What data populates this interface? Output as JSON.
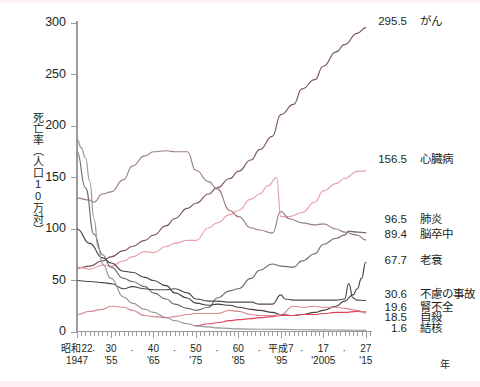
{
  "chart_data": {
    "type": "line",
    "title": "",
    "ylabel": "死亡率（人口10万対）",
    "xlabel": "年",
    "ylim": [
      0,
      300
    ],
    "xlim": [
      1947,
      2016
    ],
    "grid": false,
    "legend_position": "right-inline-callouts",
    "y_ticks": [
      "0",
      "50",
      "100",
      "150",
      "200",
      "250",
      "300"
    ],
    "x_ticks": [
      {
        "era": "昭和22",
        "west": "1947",
        "x": 1947
      },
      {
        "era": "30",
        "west": "'55",
        "x": 1955
      },
      {
        "era": "40",
        "west": "'65",
        "x": 1965
      },
      {
        "era": "50",
        "west": "'75",
        "x": 1975
      },
      {
        "era": "60",
        "west": "'85",
        "x": 1985
      },
      {
        "era": "平成7",
        "west": "'95",
        "x": 1995
      },
      {
        "era": "17",
        "west": "'2005",
        "x": 2005
      },
      {
        "era": "27",
        "west": "'15",
        "x": 2015
      }
    ],
    "x_unit_label": "年",
    "series": [
      {
        "name": "がん",
        "end_value": "295.5",
        "color": "#7a5560",
        "values": [
          [
            1947,
            62
          ],
          [
            1950,
            64
          ],
          [
            1953,
            69
          ],
          [
            1955,
            73
          ],
          [
            1958,
            79
          ],
          [
            1960,
            83
          ],
          [
            1963,
            89
          ],
          [
            1965,
            94
          ],
          [
            1968,
            103
          ],
          [
            1970,
            110
          ],
          [
            1973,
            120
          ],
          [
            1975,
            125
          ],
          [
            1978,
            134
          ],
          [
            1980,
            140
          ],
          [
            1983,
            149
          ],
          [
            1985,
            156
          ],
          [
            1988,
            167
          ],
          [
            1990,
            177
          ],
          [
            1993,
            190
          ],
          [
            1995,
            211
          ],
          [
            1998,
            221
          ],
          [
            2000,
            236
          ],
          [
            2003,
            245
          ],
          [
            2005,
            258
          ],
          [
            2008,
            272
          ],
          [
            2010,
            279
          ],
          [
            2013,
            290
          ],
          [
            2015,
            295.5
          ]
        ]
      },
      {
        "name": "心臓病",
        "end_value": "156.5",
        "color": "#e8a0a8",
        "values": [
          [
            1947,
            63
          ],
          [
            1950,
            61
          ],
          [
            1953,
            65
          ],
          [
            1955,
            64
          ],
          [
            1958,
            69
          ],
          [
            1960,
            73
          ],
          [
            1963,
            78
          ],
          [
            1965,
            77
          ],
          [
            1968,
            83
          ],
          [
            1970,
            86
          ],
          [
            1973,
            89
          ],
          [
            1975,
            89
          ],
          [
            1978,
            101
          ],
          [
            1980,
            106
          ],
          [
            1983,
            114
          ],
          [
            1985,
            118
          ],
          [
            1988,
            129
          ],
          [
            1990,
            134
          ],
          [
            1992,
            142
          ],
          [
            1994,
            150
          ],
          [
            1995,
            112
          ],
          [
            1997,
            112
          ],
          [
            2000,
            116
          ],
          [
            2003,
            126
          ],
          [
            2005,
            137
          ],
          [
            2008,
            144
          ],
          [
            2010,
            149
          ],
          [
            2013,
            156
          ],
          [
            2015,
            156.5
          ]
        ]
      },
      {
        "name": "肺炎",
        "end_value": "96.5",
        "color": "#6f6a6c",
        "values": [
          [
            1947,
            175
          ],
          [
            1949,
            140
          ],
          [
            1951,
            95
          ],
          [
            1953,
            75
          ],
          [
            1955,
            63
          ],
          [
            1958,
            52
          ],
          [
            1960,
            49
          ],
          [
            1963,
            44
          ],
          [
            1965,
            38
          ],
          [
            1968,
            32
          ],
          [
            1970,
            27
          ],
          [
            1973,
            23
          ],
          [
            1975,
            21
          ],
          [
            1978,
            24
          ],
          [
            1980,
            33
          ],
          [
            1983,
            40
          ],
          [
            1985,
            42
          ],
          [
            1988,
            52
          ],
          [
            1990,
            60
          ],
          [
            1993,
            66
          ],
          [
            1995,
            64
          ],
          [
            1998,
            63
          ],
          [
            2000,
            69
          ],
          [
            2003,
            76
          ],
          [
            2005,
            85
          ],
          [
            2008,
            91
          ],
          [
            2010,
            94
          ],
          [
            2011,
            98
          ],
          [
            2013,
            97
          ],
          [
            2015,
            96.5
          ]
        ]
      },
      {
        "name": "脳卒中",
        "end_value": "89.4",
        "color": "#9a7d85",
        "values": [
          [
            1947,
            130
          ],
          [
            1950,
            128
          ],
          [
            1951,
            126
          ],
          [
            1953,
            134
          ],
          [
            1955,
            136
          ],
          [
            1958,
            148
          ],
          [
            1960,
            161
          ],
          [
            1963,
            171
          ],
          [
            1965,
            175
          ],
          [
            1968,
            176
          ],
          [
            1970,
            175
          ],
          [
            1973,
            175
          ],
          [
            1975,
            157
          ],
          [
            1978,
            146
          ],
          [
            1980,
            139
          ],
          [
            1983,
            118
          ],
          [
            1985,
            112
          ],
          [
            1988,
            101
          ],
          [
            1990,
            99
          ],
          [
            1993,
            96
          ],
          [
            1995,
            117
          ],
          [
            1997,
            110
          ],
          [
            2000,
            106
          ],
          [
            2003,
            104
          ],
          [
            2005,
            105
          ],
          [
            2008,
            100
          ],
          [
            2010,
            97
          ],
          [
            2013,
            94
          ],
          [
            2015,
            89.4
          ]
        ]
      },
      {
        "name": "老衰",
        "end_value": "67.7",
        "color": "#4a3a40",
        "values": [
          [
            1947,
            100
          ],
          [
            1950,
            86
          ],
          [
            1953,
            72
          ],
          [
            1955,
            67
          ],
          [
            1958,
            59
          ],
          [
            1960,
            58
          ],
          [
            1963,
            53
          ],
          [
            1965,
            50
          ],
          [
            1968,
            45
          ],
          [
            1970,
            38
          ],
          [
            1973,
            33
          ],
          [
            1975,
            28
          ],
          [
            1978,
            26
          ],
          [
            1980,
            27
          ],
          [
            1983,
            26
          ],
          [
            1985,
            24
          ],
          [
            1988,
            22
          ],
          [
            1990,
            21
          ],
          [
            1993,
            19
          ],
          [
            1995,
            17
          ],
          [
            1998,
            16
          ],
          [
            2000,
            17
          ],
          [
            2003,
            19
          ],
          [
            2005,
            21
          ],
          [
            2008,
            25
          ],
          [
            2010,
            30
          ],
          [
            2012,
            36
          ],
          [
            2013,
            42
          ],
          [
            2014,
            52
          ],
          [
            2015,
            67.7
          ]
        ]
      },
      {
        "name": "不慮の事故",
        "end_value": "30.6",
        "color": "#4f4a4c",
        "values": [
          [
            1947,
            50
          ],
          [
            1950,
            49
          ],
          [
            1953,
            48
          ],
          [
            1955,
            47
          ],
          [
            1958,
            42
          ],
          [
            1960,
            44
          ],
          [
            1963,
            42
          ],
          [
            1965,
            41
          ],
          [
            1968,
            41
          ],
          [
            1970,
            42
          ],
          [
            1973,
            38
          ],
          [
            1975,
            32
          ],
          [
            1978,
            30
          ],
          [
            1980,
            30
          ],
          [
            1983,
            29
          ],
          [
            1985,
            29
          ],
          [
            1988,
            29
          ],
          [
            1990,
            27
          ],
          [
            1993,
            27
          ],
          [
            1995,
            36
          ],
          [
            1996,
            32
          ],
          [
            1998,
            31
          ],
          [
            2000,
            31
          ],
          [
            2003,
            31
          ],
          [
            2005,
            31
          ],
          [
            2008,
            31
          ],
          [
            2010,
            32
          ],
          [
            2011,
            47
          ],
          [
            2012,
            33
          ],
          [
            2013,
            31
          ],
          [
            2015,
            30.6
          ]
        ]
      },
      {
        "name": "腎不全",
        "end_value": "19.6",
        "color": "#e2435c",
        "values": [
          [
            1975,
            6
          ],
          [
            1978,
            8
          ],
          [
            1980,
            9
          ],
          [
            1983,
            11
          ],
          [
            1985,
            12
          ],
          [
            1988,
            13
          ],
          [
            1990,
            14
          ],
          [
            1993,
            15
          ],
          [
            1995,
            16
          ],
          [
            1998,
            16
          ],
          [
            2000,
            17
          ],
          [
            2003,
            17
          ],
          [
            2005,
            18
          ],
          [
            2008,
            19
          ],
          [
            2010,
            19
          ],
          [
            2013,
            20
          ],
          [
            2015,
            19.6
          ]
        ]
      },
      {
        "name": "自殺",
        "end_value": "18.5",
        "color": "#d9888f",
        "values": [
          [
            1947,
            17
          ],
          [
            1950,
            20
          ],
          [
            1953,
            22
          ],
          [
            1955,
            25
          ],
          [
            1958,
            24
          ],
          [
            1960,
            21
          ],
          [
            1963,
            16
          ],
          [
            1965,
            15
          ],
          [
            1968,
            14
          ],
          [
            1970,
            15
          ],
          [
            1973,
            17
          ],
          [
            1975,
            18
          ],
          [
            1978,
            18
          ],
          [
            1980,
            18
          ],
          [
            1983,
            21
          ],
          [
            1985,
            20
          ],
          [
            1988,
            17
          ],
          [
            1990,
            16
          ],
          [
            1993,
            16
          ],
          [
            1995,
            17
          ],
          [
            1998,
            25
          ],
          [
            2000,
            24
          ],
          [
            2003,
            25
          ],
          [
            2005,
            24
          ],
          [
            2008,
            24
          ],
          [
            2010,
            23
          ],
          [
            2013,
            21
          ],
          [
            2015,
            18.5
          ]
        ]
      },
      {
        "name": "結核",
        "end_value": "1.6",
        "color": "#9a9597",
        "values": [
          [
            1947,
            187
          ],
          [
            1948,
            179
          ],
          [
            1949,
            169
          ],
          [
            1950,
            146
          ],
          [
            1951,
            110
          ],
          [
            1952,
            82
          ],
          [
            1953,
            66
          ],
          [
            1955,
            52
          ],
          [
            1958,
            34
          ],
          [
            1960,
            28
          ],
          [
            1963,
            22
          ],
          [
            1965,
            19
          ],
          [
            1968,
            14
          ],
          [
            1970,
            11
          ],
          [
            1973,
            8
          ],
          [
            1975,
            6
          ],
          [
            1978,
            5
          ],
          [
            1980,
            4
          ],
          [
            1985,
            3
          ],
          [
            1990,
            2.7
          ],
          [
            1995,
            2.6
          ],
          [
            2000,
            2.2
          ],
          [
            2005,
            2
          ],
          [
            2010,
            1.8
          ],
          [
            2015,
            1.6
          ]
        ]
      }
    ]
  }
}
